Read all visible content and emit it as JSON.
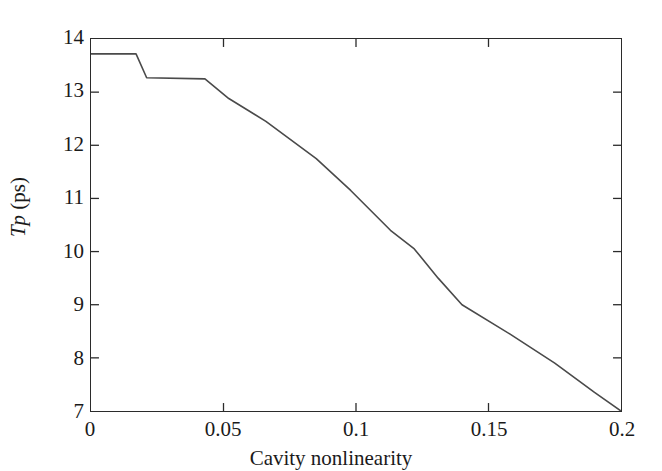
{
  "chart_data": {
    "type": "line",
    "title": "",
    "xlabel": "Cavity nonlinearity",
    "ylabel": "Tp (ps)",
    "ylabel_parts": {
      "symbol_T": "T",
      "symbol_p": "p",
      "unit": "(ps)"
    },
    "xlim": [
      0,
      0.2
    ],
    "ylim": [
      7,
      14
    ],
    "xticks": [
      0,
      0.05,
      0.1,
      0.15,
      0.2
    ],
    "xticklabels": [
      "0",
      "0.05",
      "0.1",
      "0.15",
      "0.2"
    ],
    "yticks": [
      7,
      8,
      9,
      10,
      11,
      12,
      13,
      14
    ],
    "yticklabels": [
      "7",
      "8",
      "9",
      "10",
      "11",
      "12",
      "13",
      "14"
    ],
    "grid": false,
    "legend": false,
    "legend_position": "none",
    "tick_direction": "in",
    "frame": "box",
    "line_color": "#4a4a4a",
    "line_width": 1.6,
    "series": [
      {
        "name": "Tp",
        "x": [
          0.0,
          0.017,
          0.021,
          0.043,
          0.052,
          0.066,
          0.085,
          0.098,
          0.113,
          0.122,
          0.131,
          0.14,
          0.158,
          0.175,
          0.19,
          0.2
        ],
        "y": [
          13.72,
          13.72,
          13.27,
          13.25,
          12.88,
          12.45,
          11.75,
          11.15,
          10.4,
          10.05,
          9.5,
          9.0,
          8.45,
          7.9,
          7.35,
          7.0
        ]
      }
    ]
  },
  "axes": {
    "x_axis_label": "Cavity nonlinearity",
    "y_axis_label": "Tp (ps)"
  },
  "colors": {
    "line": "#4a4a4a",
    "frame": "#2b2b2b",
    "background": "#ffffff",
    "text": "#1a1a1a"
  }
}
